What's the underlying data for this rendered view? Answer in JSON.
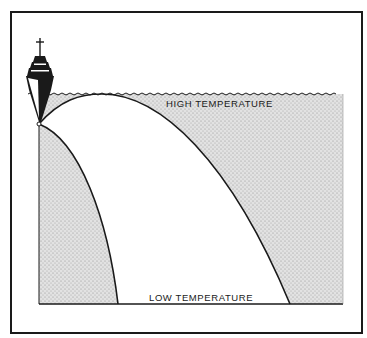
{
  "diagram": {
    "type": "sound-ray-refraction",
    "labels": {
      "top": "HIGH TEMPERATURE",
      "bottom": "LOW TEMPERATURE"
    },
    "colors": {
      "ink": "#1a1a1a",
      "shade": "#d9d9d9",
      "background": "#ffffff"
    },
    "elements": [
      "ship",
      "water-surface",
      "shaded-water-region",
      "sound-ray-inner",
      "sound-ray-outer",
      "sea-floor-line",
      "frame"
    ]
  }
}
